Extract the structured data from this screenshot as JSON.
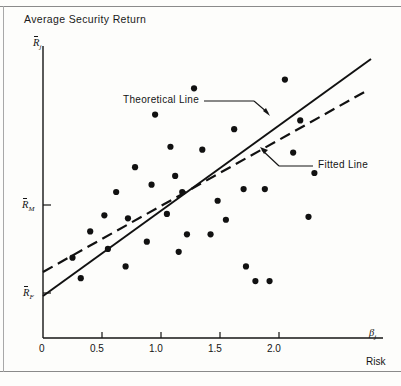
{
  "figure": {
    "title": "Average Security Return",
    "yaxis_symbol_base": "R",
    "yaxis_symbol_sub": "j",
    "xaxis_symbol_base": "β",
    "xaxis_symbol_sub": "j",
    "xaxis_caption": "Risk"
  },
  "annotations": {
    "theoretical_line": "Theoretical Line",
    "fitted_line": "Fitted Line"
  },
  "chart_data": {
    "type": "scatter",
    "title": "Average Security Return",
    "xlabel": "Risk",
    "ylabel": "Average Security Return",
    "x_symbol": "beta_j",
    "y_symbol": "R_j_bar",
    "grid": false,
    "legend": "inline-annotations",
    "xlim": [
      0,
      2.45
    ],
    "ylim": [
      0,
      1.0
    ],
    "x_ticks": [
      0,
      0.5,
      1.0,
      1.5,
      2.0
    ],
    "x_tick_labels": [
      "0",
      "0.5",
      "1.0",
      "1.5",
      "2.0"
    ],
    "y_ticks": [
      0.155,
      0.455
    ],
    "y_tick_labels": [
      "R_F_bar",
      "R_M_bar"
    ],
    "points": [
      [
        0.25,
        0.275
      ],
      [
        0.32,
        0.205
      ],
      [
        0.4,
        0.365
      ],
      [
        0.52,
        0.42
      ],
      [
        0.55,
        0.305
      ],
      [
        0.62,
        0.5
      ],
      [
        0.7,
        0.245
      ],
      [
        0.72,
        0.41
      ],
      [
        0.78,
        0.585
      ],
      [
        0.88,
        0.33
      ],
      [
        0.92,
        0.525
      ],
      [
        0.95,
        0.765
      ],
      [
        1.05,
        0.425
      ],
      [
        1.08,
        0.655
      ],
      [
        1.12,
        0.555
      ],
      [
        1.15,
        0.295
      ],
      [
        1.18,
        0.5
      ],
      [
        1.22,
        0.355
      ],
      [
        1.28,
        0.855
      ],
      [
        1.35,
        0.645
      ],
      [
        1.42,
        0.355
      ],
      [
        1.48,
        0.47
      ],
      [
        1.55,
        0.405
      ],
      [
        1.62,
        0.715
      ],
      [
        1.7,
        0.51
      ],
      [
        1.72,
        0.245
      ],
      [
        1.8,
        0.195
      ],
      [
        1.88,
        0.51
      ],
      [
        1.92,
        0.195
      ],
      [
        2.05,
        0.885
      ],
      [
        2.12,
        0.635
      ],
      [
        2.18,
        0.745
      ],
      [
        2.25,
        0.415
      ],
      [
        2.3,
        0.565
      ]
    ],
    "lines": [
      {
        "name": "Theoretical Line",
        "style": "solid",
        "intercept_label": "R_F_bar",
        "x_start": 0.0,
        "y_start": 0.145,
        "x_end": 2.4,
        "y_end": 0.965
      },
      {
        "name": "Fitted Line",
        "style": "dashed",
        "x_start": 0.0,
        "y_start": 0.23,
        "x_end": 2.37,
        "y_end": 0.855
      }
    ]
  }
}
